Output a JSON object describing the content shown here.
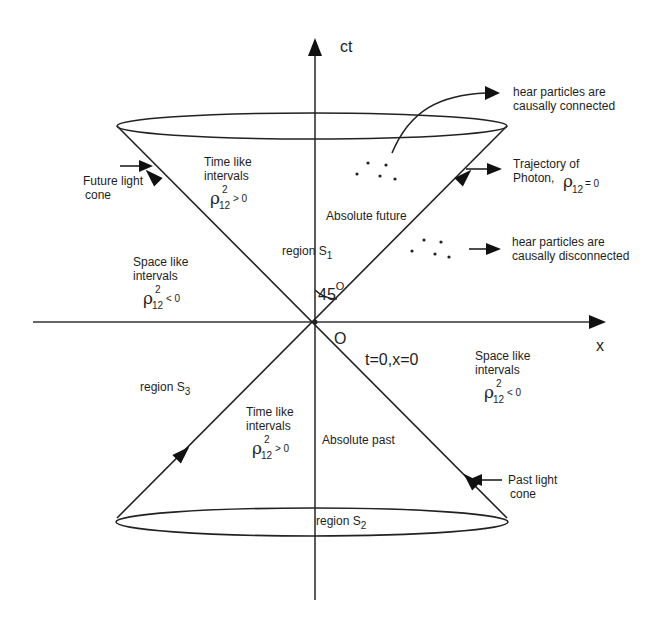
{
  "diagram": {
    "axes": {
      "vertical": "ct",
      "horizontal": "x",
      "origin": "O",
      "origin_condition": "t=0,x=0",
      "angle": "45",
      "angle_unit": "O"
    },
    "regions": {
      "s1": {
        "label": "region S",
        "subscript": "1",
        "name": "Absolute future"
      },
      "s2": {
        "label": "region S",
        "subscript": "2",
        "name": "Absolute past"
      },
      "s3": {
        "label": "region S",
        "subscript": "3"
      }
    },
    "intervals": {
      "timelike_future": {
        "line1": "Time like",
        "line2": "intervals",
        "symbol": "ρ",
        "sup": "2",
        "sub": "12",
        "relation": "> 0"
      },
      "timelike_past": {
        "line1": "Time like",
        "line2": "intervals",
        "symbol": "ρ",
        "sup": "2",
        "sub": "12",
        "relation": "> 0"
      },
      "spacelike_left": {
        "line1": "Space like",
        "line2": "intervals",
        "symbol": "ρ",
        "sup": "2",
        "sub": "12",
        "relation": "< 0"
      },
      "spacelike_right": {
        "line1": "Space like",
        "line2": "intervals",
        "symbol": "ρ",
        "sup": "2",
        "sub": "12",
        "relation": "< 0"
      }
    },
    "annotations": {
      "future_cone": {
        "line1": "Future light",
        "line2": "cone"
      },
      "past_cone": {
        "line1": "Past light",
        "line2": "cone"
      },
      "photon": {
        "line1": "Trajectory of",
        "line2": "Photon,",
        "symbol": "ρ",
        "sub": "12",
        "relation": "= 0"
      },
      "connected": {
        "line1": "hear particles are",
        "line2": "causally connected"
      },
      "disconnected": {
        "line1": "hear particles are",
        "line2": "causally disconnected"
      }
    },
    "colors": {
      "ink": "#1e1e1e",
      "background": "#ffffff"
    }
  }
}
